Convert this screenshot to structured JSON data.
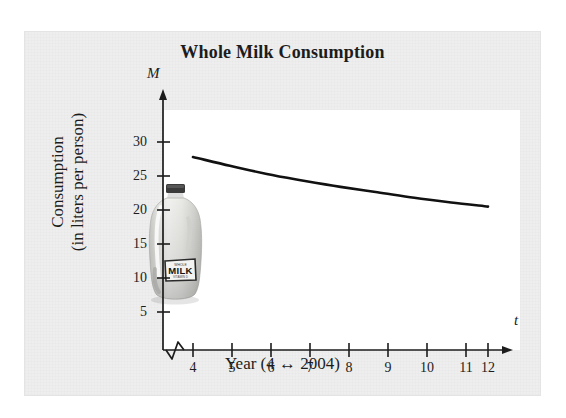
{
  "figure": {
    "title": "Whole Milk Consumption",
    "y_axis_variable": "M",
    "x_axis_variable": "t",
    "y_axis_title_line1": "Consumption",
    "y_axis_title_line2": "(in liters per person)",
    "x_axis_title": "Year (4 ↔ 2004)",
    "jug_label_text": "MILK",
    "jug_label_top_text": "WHOLE",
    "jug_label_bottom_text": "VITAMIN D",
    "colors": {
      "card_background": "#eeeeee",
      "plot_background": "#ffffff",
      "axis": "#1c1c1c",
      "curve": "#111111",
      "text": "#1c1c1c",
      "jug_body": "#e9e9e7",
      "jug_cap": "#3a3a3a"
    }
  },
  "chart_data": {
    "type": "line",
    "title": "Whole Milk Consumption",
    "xlabel": "Year (4 ↔ 2004)",
    "ylabel": "Consumption (in liters per person)",
    "x_symbol": "t",
    "y_symbol": "M",
    "xlim": [
      4,
      12
    ],
    "ylim": [
      0,
      32
    ],
    "grid": false,
    "legend": false,
    "axis_break_on_x": true,
    "xticks": [
      4,
      5,
      6,
      7,
      8,
      9,
      10,
      11,
      12
    ],
    "xtick_labels": [
      "4",
      "5",
      "6",
      "7",
      "8",
      "9",
      "10",
      "11",
      "12"
    ],
    "yticks": [
      5,
      10,
      15,
      20,
      25,
      30
    ],
    "ytick_labels": [
      "5",
      "10",
      "15",
      "20",
      "25",
      "30"
    ],
    "series": [
      {
        "name": "Whole milk consumption",
        "x": [
          4,
          5,
          6,
          7,
          8,
          9,
          10,
          11,
          12
        ],
        "values": [
          27.8,
          26.5,
          25.3,
          24.3,
          23.4,
          22.6,
          21.8,
          21.1,
          20.5
        ]
      }
    ]
  }
}
